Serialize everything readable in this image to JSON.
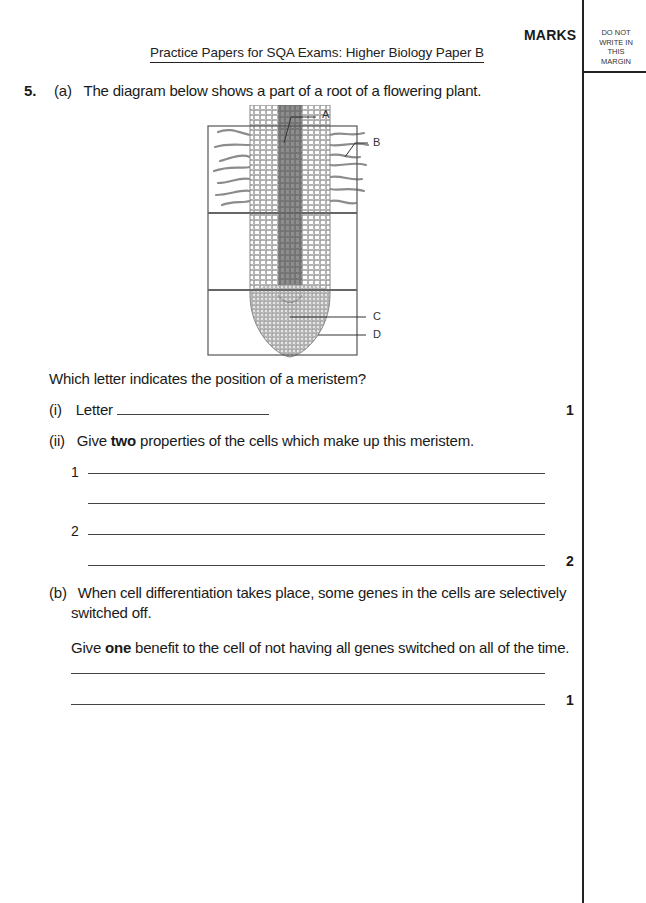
{
  "header": {
    "title": "Practice Papers for SQA Exams: Higher Biology Paper B",
    "marks_label": "MARKS",
    "margin_note": [
      "DO NOT",
      "WRITE IN",
      "THIS",
      "MARGIN"
    ]
  },
  "question": {
    "number": "5.",
    "part_a": {
      "label": "(a)",
      "text": "The diagram below shows a part of a root of a flowering plant.",
      "diagram": {
        "description": "Longitudinal section of a plant root tip with root hairs, divided into three regions",
        "labels": [
          "A",
          "B",
          "C",
          "D"
        ]
      },
      "prompt": "Which letter indicates the position of a meristem?",
      "sub_i": {
        "label": "(i)",
        "text": "Letter",
        "mark": "1"
      },
      "sub_ii": {
        "label": "(ii)",
        "text_before": "Give ",
        "text_bold": "two",
        "text_after": " properties of the cells which make up this meristem.",
        "answer_numbers": [
          "1",
          "2"
        ],
        "mark": "2"
      }
    },
    "part_b": {
      "label": "(b)",
      "text_line1": "When cell differentiation takes place, some genes in the cells are selectively",
      "text_line2": "switched off.",
      "prompt_before": "Give ",
      "prompt_bold": "one",
      "prompt_after": " benefit to the cell of not having all genes switched on all of the time.",
      "mark": "1"
    }
  }
}
